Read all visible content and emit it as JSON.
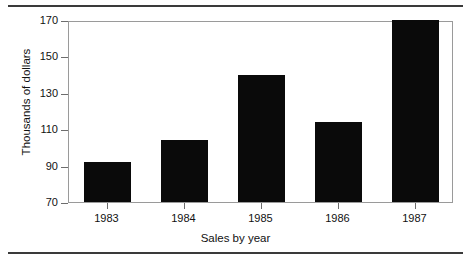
{
  "chart_data": {
    "type": "bar",
    "title": "",
    "categories": [
      "1983",
      "1984",
      "1985",
      "1986",
      "1987"
    ],
    "values": [
      92,
      104,
      140,
      114,
      171
    ],
    "series": [
      {
        "name": "Sales",
        "values": [
          92,
          104,
          140,
          114,
          171
        ]
      }
    ],
    "xlabel": "Sales by year",
    "ylabel": "Thousands of dollars",
    "ylim": [
      70,
      170
    ],
    "yticks": [
      70,
      90,
      110,
      130,
      150,
      170
    ],
    "ytick_labels": [
      "70",
      "90",
      "110",
      "130",
      "150",
      "170"
    ],
    "grid": false,
    "legend": null,
    "bar_color": "#0a0a0a",
    "frame_color": "#9a9a9a",
    "rule_color": "#3a3a3a"
  },
  "axes": {
    "y_title": "Thousands of dollars",
    "x_title": "Sales by year",
    "y_ticks": [
      {
        "label": "170",
        "value": 170
      },
      {
        "label": "150",
        "value": 150
      },
      {
        "label": "130",
        "value": 130
      },
      {
        "label": "110",
        "value": 110
      },
      {
        "label": "90",
        "value": 90
      },
      {
        "label": "70",
        "value": 70
      }
    ],
    "x_ticks": [
      {
        "label": "1983"
      },
      {
        "label": "1984"
      },
      {
        "label": "1985"
      },
      {
        "label": "1986"
      },
      {
        "label": "1987"
      }
    ]
  }
}
